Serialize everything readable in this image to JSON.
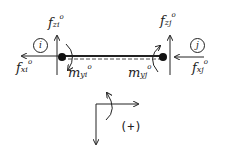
{
  "diagram": {
    "node_i_label": "i",
    "node_j_label": "j",
    "labels": {
      "f_xi": {
        "base": "f",
        "sub": "xi",
        "sup": "o"
      },
      "f_zi": {
        "base": "f",
        "sub": "zi",
        "sup": "o"
      },
      "f_xj": {
        "base": "f",
        "sub": "xj",
        "sup": "o"
      },
      "f_zj": {
        "base": "f",
        "sub": "zj",
        "sup": "o"
      },
      "m_yi": {
        "base": "m",
        "sub": "yi",
        "sup": "o"
      },
      "m_yj": {
        "base": "m",
        "sub": "yj",
        "sup": "o"
      }
    },
    "sign_convention": "(+)",
    "colors": {
      "ink": "#222222"
    }
  }
}
